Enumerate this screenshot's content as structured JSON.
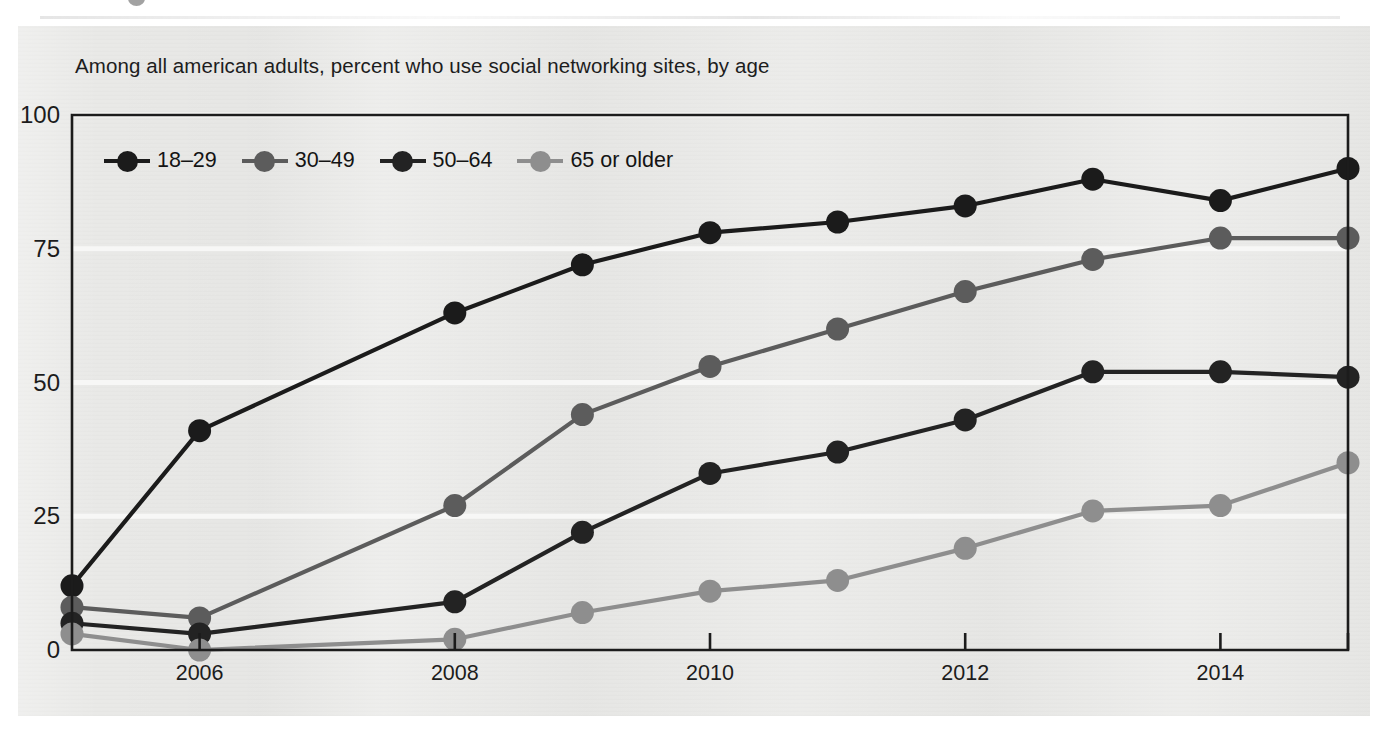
{
  "figure": {
    "title": "Among all american adults, percent who use social networking sites, by age",
    "panel_bg": "#e9e9e7",
    "page_bg": "#ffffff",
    "axis_color": "#1c1c1c",
    "gridline_color": "#f7f7f6"
  },
  "legend": {
    "position": "top-left-inside",
    "items": [
      {
        "label": "18–29",
        "color": "#1b1b1b"
      },
      {
        "label": "30–49",
        "color": "#5c5c5c"
      },
      {
        "label": "50–64",
        "color": "#232323"
      },
      {
        "label": "65 or older",
        "color": "#8e8e8e"
      }
    ]
  },
  "chart_data": {
    "type": "line",
    "title": "Among all american adults, percent who use social networking sites, by age",
    "xlabel": "",
    "ylabel": "",
    "x": [
      2005,
      2006,
      2008,
      2009,
      2010,
      2011,
      2012,
      2013,
      2014,
      2015
    ],
    "xtick_labels": [
      "2006",
      "2008",
      "2010",
      "2012",
      "2014"
    ],
    "xticks": [
      2006,
      2008,
      2010,
      2012,
      2014
    ],
    "xlim": [
      2005,
      2015
    ],
    "ylim": [
      0,
      100
    ],
    "yticks": [
      0,
      25,
      50,
      75,
      100
    ],
    "ytick_labels": [
      "0",
      "25",
      "50",
      "75",
      "100"
    ],
    "grid": "horizontal-only",
    "legend_position": "upper left (inside axes)",
    "series": [
      {
        "name": "18–29",
        "color": "#1b1b1b",
        "values": [
          12,
          41,
          63,
          72,
          78,
          80,
          83,
          88,
          84,
          90
        ]
      },
      {
        "name": "30–49",
        "color": "#5c5c5c",
        "values": [
          8,
          6,
          27,
          44,
          53,
          60,
          67,
          73,
          77,
          77
        ]
      },
      {
        "name": "50–64",
        "color": "#232323",
        "values": [
          5,
          3,
          9,
          22,
          33,
          37,
          43,
          52,
          52,
          51
        ]
      },
      {
        "name": "65 or older",
        "color": "#8e8e8e",
        "values": [
          3,
          0,
          2,
          7,
          11,
          13,
          19,
          26,
          27,
          35
        ]
      }
    ]
  }
}
